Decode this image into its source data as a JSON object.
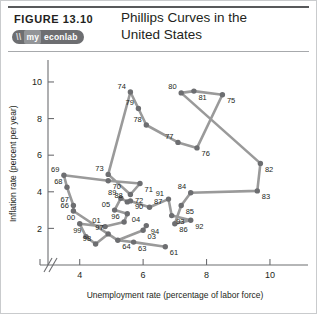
{
  "header": {
    "figure_label": "FIGURE  13.10",
    "title_line1": "Phillips Curves in the",
    "title_line2": "United States",
    "logo": {
      "slash": "\\\\",
      "my": "my",
      "rest": "econlab"
    }
  },
  "chart_data": {
    "type": "line",
    "title": "Phillips Curves in the United States",
    "xlabel": "Unemployment rate (percentage of labor force)",
    "ylabel": "Inflation rate (percent per year)",
    "xlim": [
      3.0,
      11.2
    ],
    "ylim": [
      0.0,
      11.2
    ],
    "xticks": [
      4,
      6,
      8,
      10
    ],
    "yticks": [
      2,
      4,
      6,
      8,
      10
    ],
    "grid": false,
    "legend": "none",
    "axis_break": "//",
    "series": [
      {
        "name": "Phillips curve path 1961-2005",
        "point_label_key": "year (two digits)",
        "points": [
          {
            "label": "61",
            "x": 6.7,
            "y": 1.0
          },
          {
            "label": "63",
            "x": 5.7,
            "y": 1.25
          },
          {
            "label": "64",
            "x": 5.2,
            "y": 1.35
          },
          {
            "label": "66",
            "x": 3.8,
            "y": 2.95
          },
          {
            "label": "67",
            "x": 3.8,
            "y": 3.25
          },
          {
            "label": "68",
            "x": 3.6,
            "y": 4.25
          },
          {
            "label": "69",
            "x": 3.5,
            "y": 4.9
          },
          {
            "label": "70",
            "x": 4.9,
            "y": 4.6
          },
          {
            "label": "71",
            "x": 5.9,
            "y": 4.45
          },
          {
            "label": "72",
            "x": 5.6,
            "y": 3.85
          },
          {
            "label": "73",
            "x": 4.9,
            "y": 4.95
          },
          {
            "label": "74",
            "x": 5.6,
            "y": 9.45
          },
          {
            "label": "75",
            "x": 8.5,
            "y": 9.3
          },
          {
            "label": "76",
            "x": 7.7,
            "y": 6.4
          },
          {
            "label": "77",
            "x": 7.1,
            "y": 6.7
          },
          {
            "label": "78",
            "x": 6.1,
            "y": 7.65
          },
          {
            "label": "79",
            "x": 5.85,
            "y": 8.55
          },
          {
            "label": "80",
            "x": 7.2,
            "y": 9.4
          },
          {
            "label": "81",
            "x": 7.6,
            "y": 9.5
          },
          {
            "label": "82",
            "x": 9.7,
            "y": 5.55
          },
          {
            "label": "83",
            "x": 9.6,
            "y": 4.05
          },
          {
            "label": "84",
            "x": 7.5,
            "y": 3.95
          },
          {
            "label": "85",
            "x": 7.2,
            "y": 3.25
          },
          {
            "label": "86",
            "x": 7.0,
            "y": 2.25
          },
          {
            "label": "87",
            "x": 6.2,
            "y": 3.15
          },
          {
            "label": "88",
            "x": 5.5,
            "y": 3.45
          },
          {
            "label": "89",
            "x": 5.3,
            "y": 3.65
          },
          {
            "label": "90",
            "x": 5.6,
            "y": 3.5
          },
          {
            "label": "91",
            "x": 6.8,
            "y": 3.6
          },
          {
            "label": "92",
            "x": 7.5,
            "y": 2.45
          },
          {
            "label": "93",
            "x": 6.9,
            "y": 2.7
          },
          {
            "label": "94",
            "x": 6.1,
            "y": 2.15
          },
          {
            "label": "96",
            "x": 5.4,
            "y": 2.35
          },
          {
            "label": "97",
            "x": 4.9,
            "y": 1.7
          },
          {
            "label": "98",
            "x": 4.5,
            "y": 1.15
          },
          {
            "label": "99",
            "x": 4.2,
            "y": 1.55
          },
          {
            "label": "00",
            "x": 4.0,
            "y": 2.25
          },
          {
            "label": "01",
            "x": 4.8,
            "y": 2.1
          },
          {
            "label": "03",
            "x": 6.0,
            "y": 1.9
          },
          {
            "label": "04",
            "x": 5.5,
            "y": 2.8
          },
          {
            "label": "05",
            "x": 5.1,
            "y": 3.0
          }
        ],
        "path_order": [
          "61",
          "63",
          "64",
          "66",
          "67",
          "68",
          "69",
          "70",
          "71",
          "72",
          "73",
          "74",
          "79",
          "78",
          "77",
          "76",
          "75",
          "81",
          "80",
          "82",
          "83",
          "84",
          "85",
          "86",
          "92",
          "93",
          "91",
          "87",
          "90",
          "88",
          "89",
          "05",
          "04",
          "96",
          "01",
          "00",
          "99",
          "98",
          "97",
          "64",
          "03",
          "94"
        ]
      }
    ]
  },
  "icons": {
    "axis_break_icon": "axis-break",
    "logo_icon": "myeconlab-logo"
  }
}
